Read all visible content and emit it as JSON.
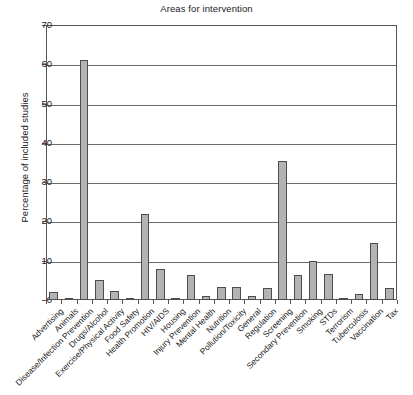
{
  "chart_data": {
    "type": "bar",
    "title": "Areas for intervention",
    "xlabel": "",
    "ylabel": "Percentage of included studies",
    "ylim": [
      0,
      70
    ],
    "ytick_step": 10,
    "yticks": [
      0,
      10,
      20,
      30,
      40,
      50,
      60,
      70
    ],
    "grid": true,
    "legend": false,
    "bar_fill_color": "#b3b3b3",
    "bar_edge_color": "#4d4d4d",
    "categories": [
      "Advertising",
      "Animals",
      "Disease/Infection Prevention",
      "Drugs/Alcohol",
      "Exercise/Physical Activity",
      "Food Safety",
      "Health Promotion",
      "HIV/AIDS",
      "Housing",
      "Injury Prevention",
      "Mental Health",
      "Nutrition",
      "Pollution/Toxicity",
      "General",
      "Regulation",
      "Screening",
      "Secondary Prevention",
      "Smoking",
      "STDs",
      "Terrorism",
      "Tuberculosis",
      "Vaccination",
      "Tax"
    ],
    "values": [
      2.0,
      0.5,
      61.2,
      5.2,
      2.4,
      0.3,
      22.0,
      8.0,
      0.5,
      6.3,
      1.0,
      3.3,
      3.2,
      1.0,
      3.0,
      35.5,
      6.3,
      9.9,
      6.5,
      0.3,
      1.5,
      14.4,
      3.0
    ]
  }
}
